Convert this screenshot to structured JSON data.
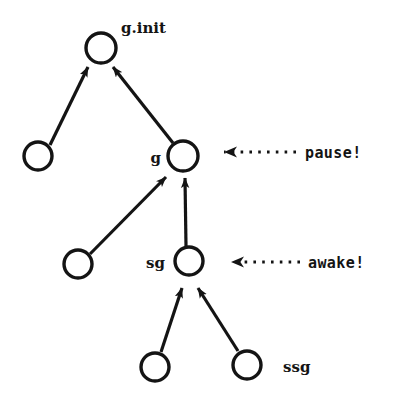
{
  "diagram": {
    "background_color": "#ffffff",
    "stroke_color": "#141414",
    "nodes": [
      {
        "id": "g_init",
        "name": "node-g-init",
        "cx": 101,
        "cy": 48,
        "r": 15,
        "label": "g.init",
        "label_x": 121,
        "label_y": 33,
        "label_anchor": "start"
      },
      {
        "id": "left_top",
        "name": "node-unlabeled-left-upper",
        "cx": 38,
        "cy": 156,
        "r": 14,
        "label": "",
        "label_x": 0,
        "label_y": 0,
        "label_anchor": "start"
      },
      {
        "id": "g",
        "name": "node-g",
        "cx": 183,
        "cy": 156,
        "r": 15,
        "label": "g",
        "label_x": 161,
        "label_y": 163,
        "label_anchor": "end"
      },
      {
        "id": "left_mid",
        "name": "node-unlabeled-left-lower",
        "cx": 78,
        "cy": 264,
        "r": 14,
        "label": "",
        "label_x": 0,
        "label_y": 0,
        "label_anchor": "start"
      },
      {
        "id": "sg",
        "name": "node-sg",
        "cx": 189,
        "cy": 261,
        "r": 14,
        "label": "sg",
        "label_x": 165,
        "label_y": 268,
        "label_anchor": "end"
      },
      {
        "id": "bottom_left",
        "name": "node-unlabeled-bottom-left",
        "cx": 155,
        "cy": 367,
        "r": 14,
        "label": "",
        "label_x": 0,
        "label_y": 0,
        "label_anchor": "start"
      },
      {
        "id": "ssg",
        "name": "node-ssg",
        "cx": 247,
        "cy": 365,
        "r": 14,
        "label": "ssg",
        "label_x": 283,
        "label_y": 372,
        "label_anchor": "start"
      }
    ],
    "edges": [
      {
        "name": "edge-left-upper-to-g-init",
        "from": "left_top",
        "to": "g_init",
        "x1": 50,
        "y1": 145,
        "x2": 88,
        "y2": 67
      },
      {
        "name": "edge-g-to-g-init",
        "from": "g",
        "to": "g_init",
        "x1": 173,
        "y1": 143,
        "x2": 113,
        "y2": 67
      },
      {
        "name": "edge-left-lower-to-g",
        "from": "left_mid",
        "to": "g",
        "x1": 90,
        "y1": 254,
        "x2": 166,
        "y2": 177
      },
      {
        "name": "edge-sg-to-g",
        "from": "sg",
        "to": "g",
        "x1": 186,
        "y1": 246,
        "x2": 185,
        "y2": 178
      },
      {
        "name": "edge-bottom-left-to-sg",
        "from": "bottom_left",
        "to": "sg",
        "x1": 161,
        "y1": 352,
        "x2": 182,
        "y2": 288
      },
      {
        "name": "edge-ssg-to-sg",
        "from": "ssg",
        "to": "sg",
        "x1": 238,
        "y1": 351,
        "x2": 198,
        "y2": 288
      }
    ],
    "messages": [
      {
        "name": "message-pause",
        "label": "pause!",
        "target": "g",
        "arrow_tip_x": 207,
        "arrow_tip_y": 152,
        "dot_start_x": 224,
        "dot_end_x": 296,
        "label_x": 305,
        "label_y": 158
      },
      {
        "name": "message-awake",
        "label": "awake!",
        "target": "sg",
        "arrow_tip_x": 214,
        "arrow_tip_y": 262,
        "dot_start_x": 231,
        "dot_end_x": 300,
        "label_x": 308,
        "label_y": 268
      }
    ]
  }
}
